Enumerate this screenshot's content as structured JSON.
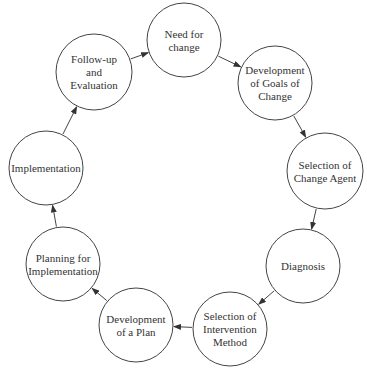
{
  "diagram": {
    "type": "cycle",
    "stroke_color": "#444444",
    "text_color": "#333333",
    "nodes": [
      {
        "id": "need-for-change",
        "lines": [
          "Need for",
          "change"
        ],
        "cx": 184,
        "cy": 40,
        "r": 37
      },
      {
        "id": "development-of-goals-of-change",
        "lines": [
          "Development",
          "of Goals of",
          "Change"
        ],
        "cx": 275,
        "cy": 83,
        "r": 37
      },
      {
        "id": "selection-of-change-agent",
        "lines": [
          "Selection of",
          "Change Agent"
        ],
        "cx": 325,
        "cy": 171,
        "r": 38
      },
      {
        "id": "diagnosis",
        "lines": [
          "Diagnosis"
        ],
        "cx": 303,
        "cy": 266,
        "r": 37
      },
      {
        "id": "selection-of-intervention-method",
        "lines": [
          "Selection of",
          "Intervention",
          "Method"
        ],
        "cx": 230,
        "cy": 329,
        "r": 37
      },
      {
        "id": "development-of-a-plan",
        "lines": [
          "Development",
          "of a Plan"
        ],
        "cx": 136,
        "cy": 325,
        "r": 37
      },
      {
        "id": "planning-for-implementation",
        "lines": [
          "Planning for",
          "Implementation"
        ],
        "cx": 63,
        "cy": 264,
        "r": 37
      },
      {
        "id": "implementation",
        "lines": [
          "Implementation"
        ],
        "cx": 46,
        "cy": 168,
        "r": 37
      },
      {
        "id": "follow-up-and-evaluation",
        "lines": [
          "Follow-up",
          "and",
          "Evaluation"
        ],
        "cx": 94,
        "cy": 72,
        "r": 38
      }
    ],
    "edges": [
      {
        "from": "need-for-change",
        "to": "development-of-goals-of-change"
      },
      {
        "from": "development-of-goals-of-change",
        "to": "selection-of-change-agent"
      },
      {
        "from": "selection-of-change-agent",
        "to": "diagnosis"
      },
      {
        "from": "diagnosis",
        "to": "selection-of-intervention-method"
      },
      {
        "from": "selection-of-intervention-method",
        "to": "development-of-a-plan"
      },
      {
        "from": "development-of-a-plan",
        "to": "planning-for-implementation"
      },
      {
        "from": "planning-for-implementation",
        "to": "implementation"
      },
      {
        "from": "implementation",
        "to": "follow-up-and-evaluation"
      },
      {
        "from": "follow-up-and-evaluation",
        "to": "need-for-change"
      }
    ]
  }
}
